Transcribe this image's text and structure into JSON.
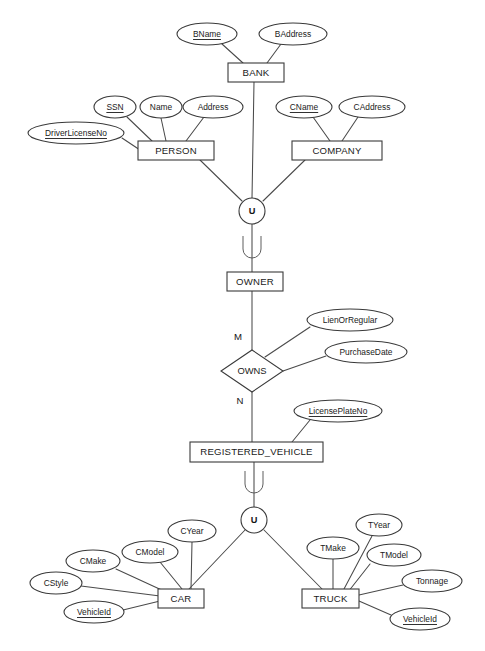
{
  "diagram": {
    "type": "entity-relationship-diagram",
    "notation": "Chen",
    "background_color": "#ffffff",
    "line_color": "#4a4a4a",
    "text_color": "#1a1a1a"
  },
  "entities": [
    {
      "id": "bank",
      "label": "BANK",
      "shape": "rectangle",
      "x": 228,
      "y": 63,
      "w": 56,
      "h": 19
    },
    {
      "id": "person",
      "label": "PERSON",
      "shape": "rectangle",
      "x": 138,
      "y": 141,
      "w": 76,
      "h": 19
    },
    {
      "id": "company",
      "label": "COMPANY",
      "shape": "rectangle",
      "x": 292,
      "y": 141,
      "w": 90,
      "h": 19
    },
    {
      "id": "owner",
      "label": "OWNER",
      "shape": "rectangle",
      "x": 227,
      "y": 272,
      "w": 56,
      "h": 19
    },
    {
      "id": "registered_vehicle",
      "label": "REGISTERED_VEHICLE",
      "shape": "rectangle",
      "x": 190,
      "y": 442,
      "w": 133,
      "h": 20
    },
    {
      "id": "car",
      "label": "CAR",
      "shape": "rectangle",
      "x": 158,
      "y": 589,
      "w": 46,
      "h": 19
    },
    {
      "id": "truck",
      "label": "TRUCK",
      "shape": "rectangle",
      "x": 302,
      "y": 589,
      "w": 57,
      "h": 19
    }
  ],
  "relationships": [
    {
      "id": "owns",
      "label": "OWNS",
      "shape": "diamond",
      "cx": 252,
      "cy": 371,
      "rx": 31,
      "ry": 21
    }
  ],
  "cardinalities": [
    {
      "id": "owner-owns",
      "label": "M",
      "x": 238,
      "y": 337
    },
    {
      "id": "owns-vehicle",
      "label": "N",
      "x": 240,
      "y": 401
    }
  ],
  "union_nodes": [
    {
      "id": "union-owner",
      "label": "U",
      "cx": 252,
      "cy": 211,
      "r": 13
    },
    {
      "id": "union-vehicle",
      "label": "U",
      "cx": 254,
      "cy": 520,
      "r": 13
    }
  ],
  "attributes": [
    {
      "id": "bname",
      "label": "BName",
      "owner": "bank",
      "key": true,
      "cx": 207,
      "cy": 34,
      "rx": 30,
      "ry": 11,
      "ax": 222,
      "ay": 44
    },
    {
      "id": "baddress",
      "label": "BAddress",
      "owner": "bank",
      "key": false,
      "cx": 293,
      "cy": 34,
      "rx": 34,
      "ry": 11,
      "ax": 281,
      "ay": 44
    },
    {
      "id": "ssn",
      "label": "SSN",
      "owner": "person",
      "key": true,
      "cx": 115,
      "cy": 107,
      "rx": 21,
      "ry": 11,
      "ax": 127,
      "ay": 117
    },
    {
      "id": "name",
      "label": "Name",
      "owner": "person",
      "key": false,
      "cx": 161,
      "cy": 107,
      "rx": 21,
      "ry": 11,
      "ax": 161,
      "ay": 118
    },
    {
      "id": "address",
      "label": "Address",
      "owner": "person",
      "key": false,
      "cx": 213,
      "cy": 107,
      "rx": 30,
      "ry": 11,
      "ax": 204,
      "ay": 117
    },
    {
      "id": "driverlicenseno",
      "label": "DriverLicenseNo",
      "owner": "person",
      "key": true,
      "cx": 76,
      "cy": 133,
      "rx": 48,
      "ry": 11,
      "ax": 122,
      "ay": 138
    },
    {
      "id": "cname",
      "label": "CName",
      "owner": "company",
      "key": true,
      "cx": 304,
      "cy": 107,
      "rx": 28,
      "ry": 11,
      "ax": 313,
      "ay": 117
    },
    {
      "id": "caddress",
      "label": "CAddress",
      "owner": "company",
      "key": false,
      "cx": 372,
      "cy": 107,
      "rx": 33,
      "ry": 11,
      "ax": 358,
      "ay": 117
    },
    {
      "id": "lienorregular",
      "label": "LienOrRegular",
      "owner": "owns",
      "key": false,
      "cx": 350,
      "cy": 320,
      "rx": 43,
      "ry": 11,
      "ax": 310,
      "ay": 327
    },
    {
      "id": "purchasedate",
      "label": "PurchaseDate",
      "owner": "owns",
      "key": false,
      "cx": 366,
      "cy": 352,
      "rx": 41,
      "ry": 11,
      "ax": 326,
      "ay": 356
    },
    {
      "id": "licenseplateno",
      "label": "LicensePlateNo",
      "owner": "registered_vehicle",
      "key": true,
      "cx": 338,
      "cy": 411,
      "rx": 44,
      "ry": 11,
      "ax": 310,
      "ay": 420
    },
    {
      "id": "cyear",
      "label": "CYear",
      "owner": "car",
      "key": false,
      "cx": 192,
      "cy": 531,
      "rx": 24,
      "ry": 11,
      "ax": 192,
      "ay": 542
    },
    {
      "id": "cmodel",
      "label": "CModel",
      "owner": "car",
      "key": false,
      "cx": 150,
      "cy": 552,
      "rx": 28,
      "ry": 11,
      "ax": 160,
      "ay": 562
    },
    {
      "id": "cmake",
      "label": "CMake",
      "owner": "car",
      "key": false,
      "cx": 93,
      "cy": 561,
      "rx": 27,
      "ry": 11,
      "ax": 116,
      "ay": 569
    },
    {
      "id": "cstyle",
      "label": "CStyle",
      "owner": "car",
      "key": false,
      "cx": 56,
      "cy": 583,
      "rx": 26,
      "ry": 11,
      "ax": 81,
      "ay": 586
    },
    {
      "id": "car_vehicleid",
      "label": "VehicleId",
      "owner": "car",
      "key": true,
      "cx": 94,
      "cy": 612,
      "rx": 30,
      "ry": 11,
      "ax": 123,
      "ay": 610
    },
    {
      "id": "tyear",
      "label": "TYear",
      "owner": "truck",
      "key": false,
      "cx": 379,
      "cy": 525,
      "rx": 23,
      "ry": 11,
      "ax": 372,
      "ay": 536
    },
    {
      "id": "tmake",
      "label": "TMake",
      "owner": "truck",
      "key": false,
      "cx": 333,
      "cy": 548,
      "rx": 26,
      "ry": 11,
      "ax": 333,
      "ay": 559
    },
    {
      "id": "tmodel",
      "label": "TModel",
      "owner": "truck",
      "key": false,
      "cx": 394,
      "cy": 555,
      "rx": 27,
      "ry": 11,
      "ax": 370,
      "ay": 564
    },
    {
      "id": "tonnage",
      "label": "Tonnage",
      "owner": "truck",
      "key": false,
      "cx": 432,
      "cy": 581,
      "rx": 30,
      "ry": 11,
      "ax": 403,
      "ay": 585
    },
    {
      "id": "truck_vehicleid",
      "label": "VehicleId",
      "owner": "truck",
      "key": true,
      "cx": 420,
      "cy": 619,
      "rx": 30,
      "ry": 11,
      "ax": 391,
      "ay": 615
    }
  ],
  "connectors": [
    {
      "id": "bname-bank",
      "x1": 222,
      "y1": 44,
      "x2": 243,
      "y2": 63
    },
    {
      "id": "baddress-bank",
      "x1": 281,
      "y1": 44,
      "x2": 267,
      "y2": 63
    },
    {
      "id": "ssn-person",
      "x1": 127,
      "y1": 117,
      "x2": 152,
      "y2": 141
    },
    {
      "id": "name-person",
      "x1": 161,
      "y1": 118,
      "x2": 166,
      "y2": 141
    },
    {
      "id": "address-person",
      "x1": 204,
      "y1": 117,
      "x2": 186,
      "y2": 141
    },
    {
      "id": "driverlicenseno-person",
      "x1": 122,
      "y1": 138,
      "x2": 140,
      "y2": 150
    },
    {
      "id": "cname-company",
      "x1": 313,
      "y1": 117,
      "x2": 330,
      "y2": 141
    },
    {
      "id": "caddress-company",
      "x1": 358,
      "y1": 117,
      "x2": 342,
      "y2": 141
    },
    {
      "id": "bank-union",
      "x1": 254,
      "y1": 82,
      "x2": 252,
      "y2": 198
    },
    {
      "id": "person-union",
      "x1": 200,
      "y1": 160,
      "x2": 242,
      "y2": 201
    },
    {
      "id": "company-union",
      "x1": 305,
      "y1": 160,
      "x2": 263,
      "y2": 201
    },
    {
      "id": "union-owner",
      "x1": 252,
      "y1": 224,
      "x2": 252,
      "y2": 272
    },
    {
      "id": "owner-owns",
      "x1": 252,
      "y1": 291,
      "x2": 252,
      "y2": 350
    },
    {
      "id": "lienorregular-owns",
      "x1": 310,
      "y1": 327,
      "x2": 265,
      "y2": 357
    },
    {
      "id": "purchasedate-owns",
      "x1": 326,
      "y1": 356,
      "x2": 283,
      "y2": 371
    },
    {
      "id": "owns-vehicle",
      "x1": 252,
      "y1": 392,
      "x2": 252,
      "y2": 442
    },
    {
      "id": "licenseplateno-vehicle",
      "x1": 310,
      "y1": 420,
      "x2": 292,
      "y2": 442
    },
    {
      "id": "vehicle-union2",
      "x1": 254,
      "y1": 462,
      "x2": 254,
      "y2": 507
    },
    {
      "id": "union2-car",
      "x1": 245,
      "y1": 530,
      "x2": 189,
      "y2": 589
    },
    {
      "id": "union2-truck",
      "x1": 264,
      "y1": 530,
      "x2": 322,
      "y2": 589
    },
    {
      "id": "cyear-car",
      "x1": 192,
      "y1": 542,
      "x2": 191,
      "y2": 589
    },
    {
      "id": "cmodel-car",
      "x1": 160,
      "y1": 562,
      "x2": 182,
      "y2": 589
    },
    {
      "id": "cmake-car",
      "x1": 116,
      "y1": 569,
      "x2": 166,
      "y2": 592
    },
    {
      "id": "cstyle-car",
      "x1": 81,
      "y1": 586,
      "x2": 160,
      "y2": 596
    },
    {
      "id": "carvehicleid-car",
      "x1": 123,
      "y1": 610,
      "x2": 160,
      "y2": 601
    },
    {
      "id": "tyear-truck",
      "x1": 372,
      "y1": 536,
      "x2": 344,
      "y2": 589
    },
    {
      "id": "tmake-truck",
      "x1": 333,
      "y1": 559,
      "x2": 333,
      "y2": 589
    },
    {
      "id": "tmodel-truck",
      "x1": 370,
      "y1": 564,
      "x2": 348,
      "y2": 592
    },
    {
      "id": "tonnage-truck",
      "x1": 403,
      "y1": 585,
      "x2": 359,
      "y2": 595
    },
    {
      "id": "truckvehicleid-truck",
      "x1": 391,
      "y1": 615,
      "x2": 359,
      "y2": 601
    }
  ],
  "subset_symbols": [
    {
      "id": "subset-owner",
      "cx": 252,
      "cy": 247,
      "label": "subset-u-symbol"
    },
    {
      "id": "subset-vehicle",
      "cx": 254,
      "cy": 482,
      "label": "subset-u-symbol"
    }
  ]
}
